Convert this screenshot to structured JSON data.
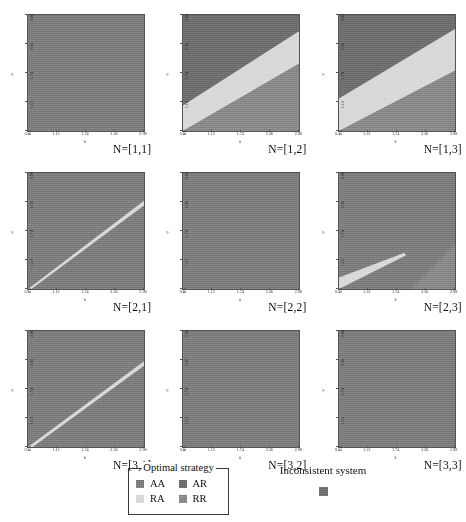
{
  "figure": {
    "title": "",
    "rows": 3,
    "cols": 3
  },
  "axes": {
    "xlabel": "k",
    "ylabel": "q",
    "xticks": [
      "0.5",
      "1.12",
      "1.74",
      "2.36",
      "2.98"
    ],
    "yticks": [
      "0.5",
      "1.12",
      "1.74",
      "2.36",
      "2.98"
    ],
    "xlim": [
      0.5,
      2.98
    ],
    "ylim": [
      0.5,
      2.98
    ]
  },
  "colors": {
    "AA": "#7e7e7e",
    "AR": "#6f6f6f",
    "RA": "#d9d9d9",
    "RR": "#8a8a8a",
    "inconsistent": "#707070",
    "panel_border": "#555555",
    "background": "#ffffff",
    "text": "#1a1a1a"
  },
  "legend": {
    "box_title": "Optimal strategy",
    "items": [
      {
        "label": "AA",
        "color": "#7e7e7e"
      },
      {
        "label": "AR",
        "color": "#6f6f6f"
      },
      {
        "label": "RA",
        "color": "#d9d9d9"
      },
      {
        "label": "RR",
        "color": "#8a8a8a"
      }
    ],
    "inconsistent_label": "Inconsistent system",
    "inconsistent_color": "#707070"
  },
  "chart_data": {
    "type": "heatmap",
    "title": "",
    "xlabel": "k",
    "ylabel": "q",
    "xlim": [
      0.5,
      2.98
    ],
    "ylim": [
      0.5,
      2.98
    ],
    "xticks": [
      "0.5",
      "1.12",
      "1.74",
      "2.36",
      "2.98"
    ],
    "yticks": [
      "0.5",
      "1.12",
      "1.74",
      "2.36",
      "2.98"
    ],
    "grid": false,
    "legend_position": "bottom",
    "category_colors": {
      "AA": "#7e7e7e",
      "AR": "#6f6f6f",
      "RA": "#d9d9d9",
      "RR": "#8a8a8a",
      "inconsistent": "#707070"
    },
    "panels": [
      {
        "tag": "N=[1,1]",
        "row": 1,
        "col": 1,
        "regions": [
          {
            "strategy": "AA",
            "color": "#7e7e7e",
            "description": "entire k-q domain uniform",
            "area_fraction": 1.0
          }
        ]
      },
      {
        "tag": "N=[1,2]",
        "row": 1,
        "col": 2,
        "regions": [
          {
            "strategy": "AR",
            "color": "#6f6f6f",
            "description": "upper-left wedge above light band",
            "area_fraction": 0.4
          },
          {
            "strategy": "RA",
            "color": "#d9d9d9",
            "description": "broad diagonal band from lower-left to upper-right",
            "area_fraction": 0.26
          },
          {
            "strategy": "RR",
            "color": "#8a8a8a",
            "description": "lower-right wedge below light band",
            "area_fraction": 0.34
          }
        ]
      },
      {
        "tag": "N=[1,3]",
        "row": 1,
        "col": 3,
        "regions": [
          {
            "strategy": "AR",
            "color": "#6f6f6f",
            "description": "upper-left wedge above light band",
            "area_fraction": 0.36
          },
          {
            "strategy": "RA",
            "color": "#d9d9d9",
            "description": "wide diagonal band, steeper than N=[1,2]",
            "area_fraction": 0.3
          },
          {
            "strategy": "RR",
            "color": "#8a8a8a",
            "description": "lower-right wedge below light band",
            "area_fraction": 0.34
          }
        ]
      },
      {
        "tag": "N=[2,1]",
        "row": 2,
        "col": 1,
        "regions": [
          {
            "strategy": "AA",
            "color": "#7e7e7e",
            "description": "dominant uniform background",
            "area_fraction": 0.96
          },
          {
            "strategy": "RA",
            "color": "#d9d9d9",
            "description": "thin light diagonal line from lower-left to upper-right",
            "area_fraction": 0.04
          }
        ]
      },
      {
        "tag": "N=[2,2]",
        "row": 2,
        "col": 2,
        "regions": [
          {
            "strategy": "AA",
            "color": "#7e7e7e",
            "description": "entire k-q domain uniform",
            "area_fraction": 1.0
          }
        ]
      },
      {
        "tag": "N=[2,3]",
        "row": 2,
        "col": 3,
        "regions": [
          {
            "strategy": "AA",
            "color": "#7e7e7e",
            "description": "dominant uniform background",
            "area_fraction": 0.9
          },
          {
            "strategy": "RA",
            "color": "#d9d9d9",
            "description": "narrow light wedge in lower-left quadrant",
            "area_fraction": 0.05
          },
          {
            "strategy": "RR",
            "color": "#8a8a8a",
            "description": "small darker wedge at lower-right corner",
            "area_fraction": 0.05
          }
        ]
      },
      {
        "tag": "N=[3,1]",
        "row": 3,
        "col": 1,
        "regions": [
          {
            "strategy": "AA",
            "color": "#7e7e7e",
            "description": "dominant uniform background",
            "area_fraction": 0.96
          },
          {
            "strategy": "RA",
            "color": "#d9d9d9",
            "description": "faint thin diagonal line from lower-left to upper-right",
            "area_fraction": 0.04
          }
        ]
      },
      {
        "tag": "N=[3,2]",
        "row": 3,
        "col": 2,
        "regions": [
          {
            "strategy": "AA",
            "color": "#7e7e7e",
            "description": "entire k-q domain uniform",
            "area_fraction": 1.0
          }
        ]
      },
      {
        "tag": "N=[3,3]",
        "row": 3,
        "col": 3,
        "regions": [
          {
            "strategy": "AA",
            "color": "#7e7e7e",
            "description": "entire k-q domain uniform",
            "area_fraction": 1.0
          }
        ]
      }
    ]
  }
}
